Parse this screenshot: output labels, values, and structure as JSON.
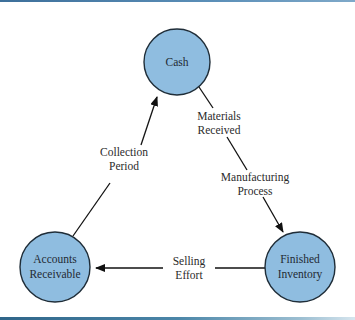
{
  "diagram": {
    "type": "cycle",
    "colors": {
      "node_fill": "#8fbde0",
      "node_stroke": "#1f2d38",
      "edge": "#111111",
      "border_accent": "#4b86a8"
    },
    "nodes": [
      {
        "id": "cash",
        "line1": "Cash",
        "line2": ""
      },
      {
        "id": "finished_inventory",
        "line1": "Finished",
        "line2": "Inventory"
      },
      {
        "id": "accounts_receivable",
        "line1": "Accounts",
        "line2": "Receivable"
      }
    ],
    "edges": [
      {
        "from": "cash",
        "to": "finished_inventory",
        "label_a1": "Materials",
        "label_a2": "Received",
        "label_b1": "Manufacturing",
        "label_b2": "Process"
      },
      {
        "from": "finished_inventory",
        "to": "accounts_receivable",
        "label1": "Selling",
        "label2": "Effort"
      },
      {
        "from": "accounts_receivable",
        "to": "cash",
        "label1": "Collection",
        "label2": "Period"
      }
    ]
  }
}
